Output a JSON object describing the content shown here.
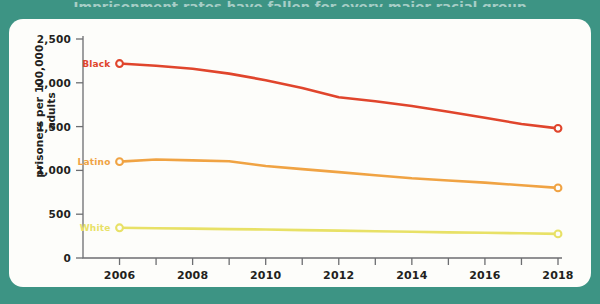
{
  "page": {
    "background_color": "#3d9484",
    "card_color": "#fdfdfa",
    "cropped_title": "Imprisonment rates have fallen for every major racial group"
  },
  "chart_data": {
    "type": "line",
    "title": "",
    "xlabel": "",
    "ylabel": "prisoners per 100,000 adults",
    "xlim": [
      2005,
      2018
    ],
    "ylim": [
      0,
      2500
    ],
    "grid": false,
    "legend_position": "inline-left-of-first-point",
    "x": [
      2006,
      2007,
      2008,
      2009,
      2010,
      2011,
      2012,
      2013,
      2014,
      2015,
      2016,
      2017,
      2018
    ],
    "xticks": [
      2006,
      2007,
      2008,
      2009,
      2010,
      2011,
      2012,
      2013,
      2014,
      2015,
      2016,
      2017,
      2018
    ],
    "xtick_labels": [
      "2006",
      "",
      "2008",
      "",
      "2010",
      "",
      "2012",
      "",
      "2014",
      "",
      "2016",
      "",
      "2018"
    ],
    "yticks": [
      0,
      500,
      1000,
      1500,
      2000,
      2500
    ],
    "ytick_labels": [
      "0",
      "500",
      "1,000",
      "1,500",
      "2,000",
      "2,500"
    ],
    "series": [
      {
        "name": "Black",
        "color": "#e0452c",
        "label": "Black",
        "values": [
          2220,
          2195,
          2160,
          2105,
          2030,
          1940,
          1835,
          1790,
          1735,
          1670,
          1600,
          1530,
          1480
        ]
      },
      {
        "name": "Latino",
        "color": "#f0a343",
        "label": "Latino",
        "values": [
          1100,
          1125,
          1115,
          1105,
          1050,
          1015,
          980,
          945,
          910,
          885,
          860,
          830,
          800
        ]
      },
      {
        "name": "White",
        "color": "#e8e166",
        "label": "White",
        "values": [
          345,
          340,
          335,
          330,
          325,
          318,
          312,
          305,
          300,
          293,
          288,
          282,
          275
        ]
      }
    ]
  },
  "axis_style": {
    "axis_color": "#6d6e71",
    "tick_color": "#6d6e71"
  }
}
